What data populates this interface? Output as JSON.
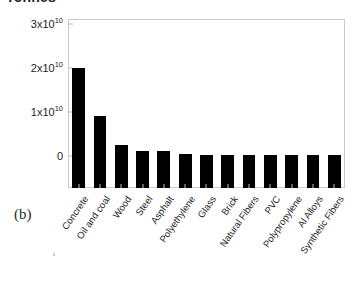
{
  "figure": {
    "panel_label": "(b)",
    "axis_title_clipped": "Tonnes"
  },
  "chart_data": {
    "type": "bar",
    "title": "Tonnes",
    "xlabel": "",
    "ylabel": "Tonnes",
    "grid": false,
    "legend": null,
    "ylim": [
      0,
      30000000000
    ],
    "ytick_values": [
      0,
      10000000000,
      20000000000,
      30000000000
    ],
    "ytick_labels": [
      "0",
      "1x10¹⁰",
      "2x10¹⁰",
      "3x10¹⁰"
    ],
    "ytick_label_parts": [
      {
        "mantissa": "0",
        "exponent": ""
      },
      {
        "mantissa": "1x10",
        "exponent": "10"
      },
      {
        "mantissa": "2x10",
        "exponent": "10"
      },
      {
        "mantissa": "3x10",
        "exponent": "10"
      }
    ],
    "categories": [
      "Concrete",
      "Oil and coal",
      "Wood",
      "Steel",
      "Asphalt",
      "Polyethylene",
      "Glass",
      "Brick",
      "Natural Fibers",
      "PVC",
      "Polypropylene",
      "Al Alloys",
      "Synthetic Fibers"
    ],
    "values": [
      20000000000,
      9000000000,
      2500000000,
      1100000000,
      1100000000,
      300000000,
      200000000,
      150000000,
      120000000,
      100000000,
      80000000,
      60000000,
      40000000
    ],
    "bar_color": "#000000",
    "frame_color": "#c9c9c9"
  }
}
